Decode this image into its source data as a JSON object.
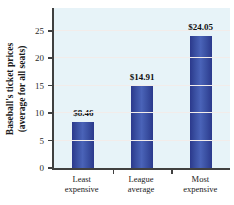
{
  "chart_data": {
    "type": "bar",
    "categories": [
      [
        "Least",
        "expensive"
      ],
      [
        "League",
        "average"
      ],
      [
        "Most",
        "expensive"
      ]
    ],
    "values": [
      8.46,
      14.91,
      24.05
    ],
    "value_labels": [
      "$8.46",
      "$14.91",
      "$24.05"
    ],
    "ylabel_line1": "Baseball's ticket prices",
    "ylabel_line2": "(average for all seats)",
    "yticks": [
      0,
      5,
      10,
      15,
      20,
      25
    ],
    "ylim": [
      0,
      29.5
    ],
    "xlabel": "",
    "title": "",
    "legend": "none",
    "grid": "horizontal",
    "colors": {
      "plot_bg": "#e7f3f8",
      "gridline": "#f2ecea",
      "axis": "#404040",
      "bar_main": "#3b51a3",
      "bar_light": "#4a63b8",
      "bar_dark": "#2b398c",
      "text": "#1b1b1b"
    }
  }
}
